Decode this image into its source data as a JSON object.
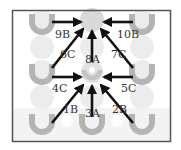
{
  "diagram": {
    "type": "move-direction diagram",
    "frame": {
      "x": 12,
      "y": 10,
      "width": 159,
      "height": 132,
      "stroke": "#555555"
    },
    "colors": {
      "cup": "#b4b4b4",
      "circle": "#ececec",
      "target_fill": "#d9d9d9",
      "arrow": "#111111",
      "band": "#f2f2f2",
      "label": "#333333"
    },
    "targets": [
      {
        "id": "top",
        "x": 92,
        "y": 20
      },
      {
        "id": "middle",
        "x": 92,
        "y": 72
      }
    ],
    "arrows": [
      {
        "label": "9B",
        "from": [
          52,
          22
        ],
        "to": [
          82,
          22
        ],
        "label_pos": [
          58,
          38
        ]
      },
      {
        "label": "10B",
        "from": [
          133,
          22
        ],
        "to": [
          103,
          22
        ],
        "label_pos": [
          119,
          38
        ]
      },
      {
        "label": "6C",
        "from": [
          52,
          68
        ],
        "to": [
          84,
          28
        ],
        "label_pos": [
          60,
          58
        ]
      },
      {
        "label": "8A",
        "from": [
          92,
          62
        ],
        "to": [
          92,
          30
        ],
        "label_pos": [
          86,
          62
        ]
      },
      {
        "label": "7C",
        "from": [
          133,
          68
        ],
        "to": [
          100,
          28
        ],
        "label_pos": [
          111,
          58
        ]
      },
      {
        "label": "4C",
        "from": [
          52,
          77
        ],
        "to": [
          82,
          77
        ],
        "label_pos": [
          52,
          92
        ]
      },
      {
        "label": "5C",
        "from": [
          133,
          77
        ],
        "to": [
          103,
          77
        ],
        "label_pos": [
          121,
          92
        ]
      },
      {
        "label": "1B",
        "from": [
          52,
          123
        ],
        "to": [
          84,
          84
        ],
        "label_pos": [
          62,
          112
        ]
      },
      {
        "label": "3A",
        "from": [
          92,
          118
        ],
        "to": [
          92,
          85
        ],
        "label_pos": [
          85,
          117
        ]
      },
      {
        "label": "2B",
        "from": [
          133,
          123
        ],
        "to": [
          100,
          84
        ],
        "label_pos": [
          112,
          112
        ]
      }
    ],
    "labels": [
      "9B",
      "10B",
      "6C",
      "8A",
      "7C",
      "4C",
      "5C",
      "1B",
      "3A",
      "2B"
    ]
  }
}
